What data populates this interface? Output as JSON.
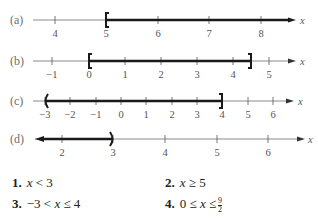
{
  "rows": [
    {
      "label": "(a)",
      "axis_y": 20,
      "x_start": 33,
      "x_end": 296,
      "left_arrow": false,
      "right_arrow": true,
      "variable": "x",
      "variable_x": 300,
      "ticks": [
        {
          "value": "4",
          "px": 55
        },
        {
          "value": "5",
          "px": 106
        },
        {
          "value": "6",
          "px": 158
        },
        {
          "value": "7",
          "px": 209
        },
        {
          "value": "8",
          "px": 261
        }
      ],
      "interval": {
        "from_px": 106,
        "to_px": 294,
        "left": "[",
        "right": "arrow"
      }
    },
    {
      "label": "(b)",
      "axis_y": 61,
      "x_start": 33,
      "x_end": 296,
      "left_arrow": false,
      "right_arrow": true,
      "variable": "x",
      "variable_x": 300,
      "ticks": [
        {
          "value": "−1",
          "px": 52
        },
        {
          "value": "0",
          "px": 89
        },
        {
          "value": "1",
          "px": 125
        },
        {
          "value": "2",
          "px": 161
        },
        {
          "value": "3",
          "px": 197
        },
        {
          "value": "4",
          "px": 233
        },
        {
          "value": "5",
          "px": 269
        }
      ],
      "interval": {
        "from_px": 89,
        "to_px": 251,
        "left": "[",
        "right": "]"
      }
    },
    {
      "label": "(c)",
      "axis_y": 101,
      "x_start": 33,
      "x_end": 294,
      "left_arrow": false,
      "right_arrow": true,
      "variable": "x",
      "variable_x": 298,
      "ticks": [
        {
          "value": "−3",
          "px": 45
        },
        {
          "value": "−2",
          "px": 70
        },
        {
          "value": "−1",
          "px": 96
        },
        {
          "value": "0",
          "px": 121
        },
        {
          "value": "1",
          "px": 146
        },
        {
          "value": "2",
          "px": 172
        },
        {
          "value": "3",
          "px": 197
        },
        {
          "value": "4",
          "px": 222
        },
        {
          "value": "5",
          "px": 248
        },
        {
          "value": "6",
          "px": 273
        }
      ],
      "interval": {
        "from_px": 45,
        "to_px": 222,
        "left": "(",
        "right": "]"
      }
    },
    {
      "label": "(d)",
      "axis_y": 139,
      "x_start": 35,
      "x_end": 305,
      "left_arrow": true,
      "right_arrow": true,
      "variable": "x",
      "variable_x": 308,
      "ticks": [
        {
          "value": "2",
          "px": 62
        },
        {
          "value": "3",
          "px": 113
        },
        {
          "value": "4",
          "px": 165
        },
        {
          "value": "5",
          "px": 217
        },
        {
          "value": "6",
          "px": 268
        }
      ],
      "interval": {
        "from_px": 35,
        "to_px": 113,
        "left": "arrow",
        "right": ")"
      }
    }
  ],
  "answers": [
    {
      "number": "1.",
      "expr": "x < 3",
      "x": 12,
      "y": 175
    },
    {
      "number": "2.",
      "expr": "x ≥ 5",
      "x": 165,
      "y": 175
    },
    {
      "number": "3.",
      "expr": "−3 < x ≤ 4",
      "x": 12,
      "y": 196
    },
    {
      "number": "4.",
      "expr": "0 ≤ x ≤",
      "x": 165,
      "y": 196,
      "frac_num": "9",
      "frac_den": "2"
    }
  ],
  "colors": {
    "axis": "#8a8a8a",
    "interval": "#1a1a1a",
    "text": "#222222"
  }
}
